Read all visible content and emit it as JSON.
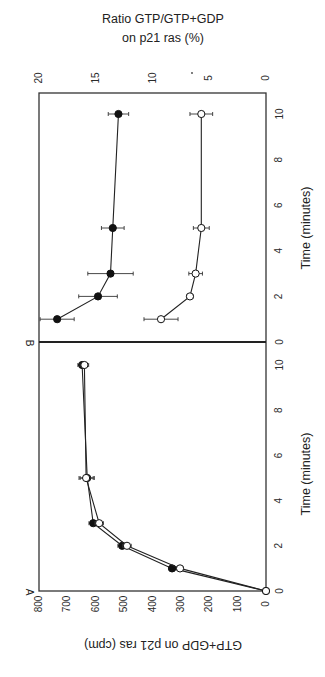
{
  "chart_data": [
    {
      "panel": "A",
      "type": "line",
      "title": "",
      "xlabel": "Time (minutes)",
      "ylabel": "GTP+GDP on p21 ras (cpm)",
      "x_ticks": [
        0,
        2,
        4,
        6,
        8,
        10
      ],
      "y_ticks": [
        0,
        100,
        200,
        300,
        400,
        500,
        600,
        700,
        800
      ],
      "xlim": [
        0,
        10
      ],
      "ylim": [
        0,
        800
      ],
      "grid": false,
      "series": [
        {
          "name": "filled circles",
          "marker": "filled-circle",
          "x": [
            0,
            1,
            2,
            3,
            5,
            10
          ],
          "y": [
            0,
            331,
            507,
            609,
            630,
            648
          ],
          "err": [
            0,
            12,
            15,
            15,
            25,
            15
          ]
        },
        {
          "name": "open circles",
          "marker": "open-circle",
          "x": [
            0,
            1,
            2,
            3,
            5,
            10
          ],
          "y": [
            0,
            303,
            490,
            588,
            634,
            640
          ],
          "err": [
            0,
            12,
            15,
            15,
            25,
            15
          ]
        }
      ]
    },
    {
      "panel": "B",
      "type": "line",
      "title": "",
      "xlabel": "Time (minutes)",
      "ylabel": "Ratio GTP/GTP+GDP on p21 ras (%)",
      "x_ticks": [
        0,
        2,
        4,
        6,
        8,
        10
      ],
      "y_ticks": [
        0,
        5,
        10,
        15,
        20
      ],
      "xlim": [
        0,
        10
      ],
      "ylim": [
        0,
        20
      ],
      "grid": false,
      "series": [
        {
          "name": "filled circles",
          "marker": "filled-circle",
          "x": [
            1,
            2,
            3,
            5,
            10
          ],
          "y": [
            18.4,
            14.8,
            13.7,
            13.5,
            13.0
          ],
          "err": [
            1.5,
            1.7,
            2.0,
            1.0,
            0.9
          ]
        },
        {
          "name": "open circles",
          "marker": "open-circle",
          "x": [
            1,
            2,
            3,
            5,
            10
          ],
          "y": [
            9.25,
            6.7,
            6.2,
            5.7,
            5.7
          ],
          "err": [
            1.5,
            0.3,
            0.6,
            0.7,
            1.0
          ]
        }
      ]
    }
  ],
  "labels": {
    "panel_a": "A",
    "panel_b": "B",
    "x_axis_title": "Time  (minutes)",
    "y_axis_a_title": "GTP+GDP on p21 ras (cpm)",
    "y_axis_b_title_line1": "Ratio GTP/GTP+GDP",
    "y_axis_b_title_line2": "on p21 ras (%)"
  }
}
